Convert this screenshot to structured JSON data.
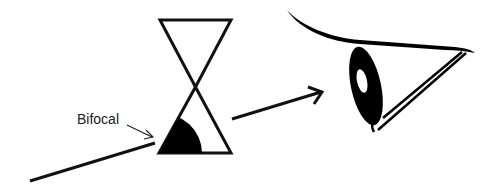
{
  "diagram": {
    "labels": {
      "bifocal": "Bifocal"
    },
    "elements": [
      {
        "name": "incoming-light-ray",
        "type": "line"
      },
      {
        "name": "lens-hourglass",
        "type": "shape",
        "note": "two triangles meeting at apex"
      },
      {
        "name": "bifocal-segment",
        "type": "filled-quarter-circle"
      },
      {
        "name": "bifocal-pointer-arrow",
        "type": "arrow"
      },
      {
        "name": "outgoing-light-ray",
        "type": "arrow"
      },
      {
        "name": "eye",
        "type": "illustration"
      }
    ],
    "colors": {
      "stroke": "#111111",
      "fill": "#000000",
      "background": "#ffffff",
      "text": "#222222"
    }
  }
}
